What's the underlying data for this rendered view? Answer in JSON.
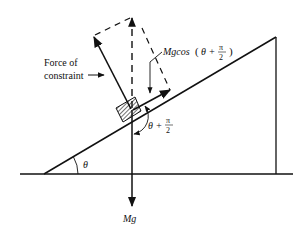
{
  "diagram": {
    "labels": {
      "constraint_line1": "Force of",
      "constraint_line2": "constraint",
      "component": "Mgcos",
      "component_paren_open": "(",
      "component_theta": "θ +",
      "pi": "π",
      "two": "2",
      "component_paren_close": ")",
      "angle_theta": "θ",
      "angle_sum_theta": "θ +",
      "weight": "Mg"
    },
    "colors": {
      "stroke": "#111111",
      "background": "#ffffff"
    }
  }
}
